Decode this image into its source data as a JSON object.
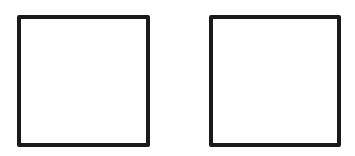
{
  "canvas": {
    "width": 355,
    "height": 156,
    "background": "#ffffff"
  },
  "shapes": [
    {
      "type": "square",
      "id": "left",
      "x": 17,
      "y": 15,
      "width": 133,
      "height": 132,
      "stroke": "#1a1a1a",
      "stroke_width": 4,
      "fill": "#ffffff"
    },
    {
      "type": "square",
      "id": "right",
      "x": 209,
      "y": 15,
      "width": 132,
      "height": 132,
      "stroke": "#1a1a1a",
      "stroke_width": 4,
      "fill": "#ffffff"
    }
  ]
}
